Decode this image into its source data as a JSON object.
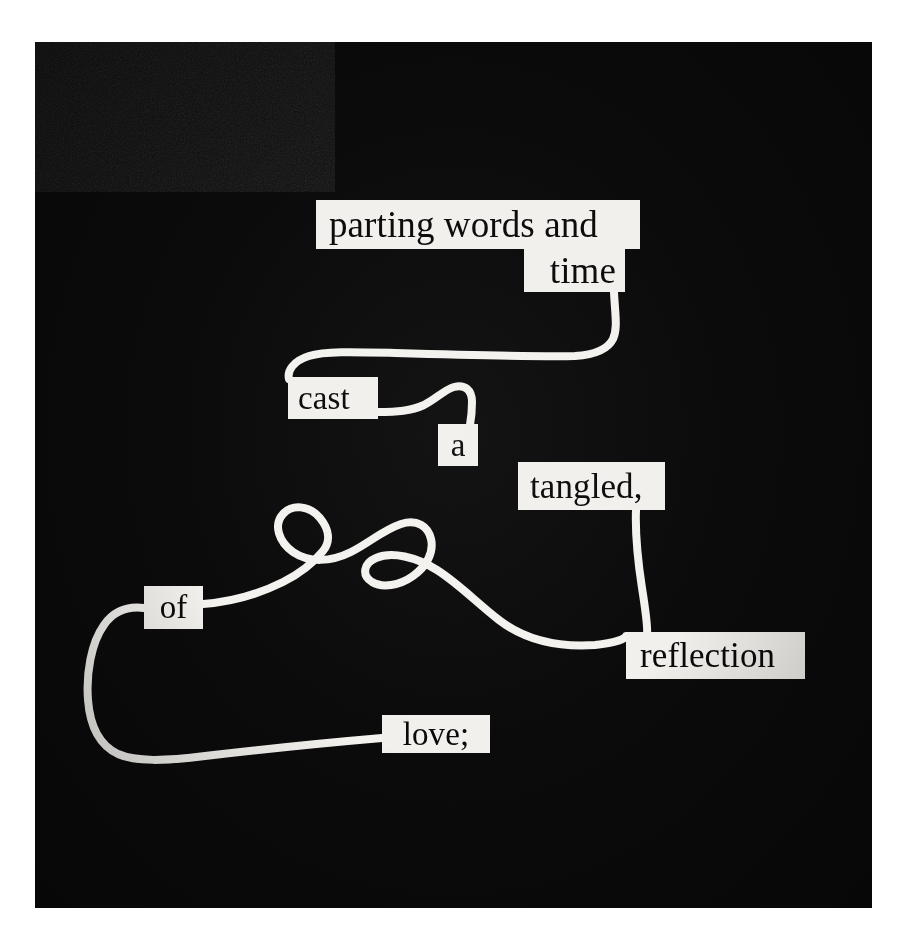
{
  "artwork": {
    "kind": "found-poetry-string-collage",
    "medium_note": "white cord on black ground with cut paper word chips",
    "background_color": "#ffffff",
    "panel_color": "#0b0b0b",
    "chip_color": "#f2f0ec",
    "ink_color": "#0a0a0a",
    "string_color": "#f4f2ee",
    "poem_reading_order": [
      "parting words and",
      "time",
      "cast",
      "a",
      "tangled,",
      "reflection",
      "of",
      "love;"
    ],
    "poem_text": "parting words and time cast a tangled, reflection of love;",
    "chips": [
      {
        "id": "parting",
        "text": "parting words and"
      },
      {
        "id": "time",
        "text": "time"
      },
      {
        "id": "cast",
        "text": "cast"
      },
      {
        "id": "a",
        "text": "a"
      },
      {
        "id": "tangled",
        "text": "tangled,"
      },
      {
        "id": "reflection",
        "text": "reflection"
      },
      {
        "id": "of",
        "text": "of"
      },
      {
        "id": "love",
        "text": "love;"
      }
    ]
  }
}
